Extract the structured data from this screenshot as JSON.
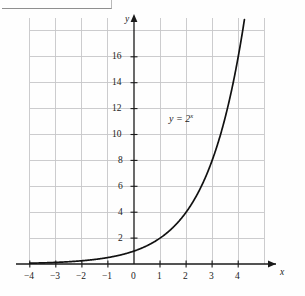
{
  "figure": {
    "kind": "cartesian-graph",
    "background_color": "#fefefe",
    "grid_color": "#c5c5c8",
    "axis_color": "#1a1a1a",
    "curve_color": "#111111"
  },
  "axes": {
    "x_axis_name": "x",
    "y_axis_name": "y",
    "x_ticks": [
      "−4",
      "−3",
      "−2",
      "−1",
      "0",
      "1",
      "2",
      "3",
      "4"
    ],
    "x_tick_values": [
      -4,
      -3,
      -2,
      -1,
      0,
      1,
      2,
      3,
      4
    ],
    "y_ticks": [
      "2",
      "4",
      "6",
      "8",
      "10",
      "12",
      "14",
      "16"
    ],
    "y_tick_values": [
      2,
      4,
      6,
      8,
      10,
      12,
      14,
      16
    ]
  },
  "annotations": {
    "curve_label_lhs": "y = 2",
    "curve_label_exponent": "x"
  },
  "chart_data": {
    "type": "line",
    "title": "",
    "subtitle": "",
    "xlabel": "x",
    "ylabel": "y",
    "xlim": [
      -4.3,
      4.6
    ],
    "ylim": [
      -0.9,
      18.2
    ],
    "grid": true,
    "grid_x_step": 1,
    "grid_y_step": 2,
    "legend": "none",
    "series": [
      {
        "name": "y = 2^x",
        "equation": "y = 2^x",
        "base": 2,
        "x": [
          -4,
          -3.5,
          -3,
          -2.5,
          -2,
          -1.5,
          -1,
          -0.5,
          0,
          0.5,
          1,
          1.5,
          2,
          2.5,
          3,
          3.5,
          4,
          4.1
        ],
        "values": [
          0.0625,
          0.0884,
          0.125,
          0.1768,
          0.25,
          0.3536,
          0.5,
          0.7071,
          1,
          1.4142,
          2,
          2.8284,
          4,
          5.6569,
          8,
          11.3137,
          16,
          17.148
        ]
      }
    ],
    "annotations": [
      {
        "text": "y = 2^x",
        "x": 1.55,
        "y": 11.2
      }
    ]
  }
}
